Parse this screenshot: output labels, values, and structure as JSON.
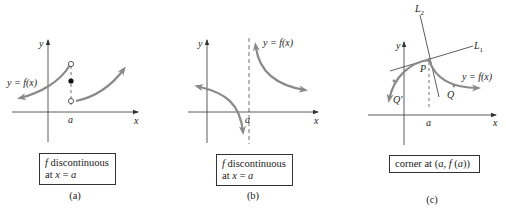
{
  "colors": {
    "curve": "#8a8a8a",
    "axis": "#333333",
    "text": "#222222",
    "background": "#ffffff"
  },
  "panels": [
    {
      "id": "a",
      "caption": "(a)",
      "axis_labels": {
        "x": "x",
        "y": "y"
      },
      "tick_label": "a",
      "curve_label": "y = f(x)",
      "box": {
        "line1_italic": "f",
        "line1_rest": " discontinuous",
        "line2_prefix": "at ",
        "line2_italic": "x",
        "line2_mid": " = ",
        "line2_end": "a"
      },
      "markers": [
        "open-circle-top",
        "filled-dot-middle",
        "open-circle-bottom"
      ]
    },
    {
      "id": "b",
      "caption": "(b)",
      "axis_labels": {
        "x": "x",
        "y": "y"
      },
      "tick_label": "a",
      "curve_label": "y = f(x)",
      "box": {
        "line1_italic": "f",
        "line1_rest": " discontinuous",
        "line2_prefix": "at ",
        "line2_italic": "x",
        "line2_mid": " = ",
        "line2_end": "a"
      },
      "asymptote": "vertical dashed line at x = a"
    },
    {
      "id": "c",
      "caption": "(c)",
      "axis_labels": {
        "x": "x",
        "y": "y"
      },
      "tick_label": "a",
      "curve_label": "y = f(x)",
      "line_labels": {
        "l1": "L",
        "l1_sub": "1",
        "l2": "L",
        "l2_sub": "2"
      },
      "point_labels": {
        "p": "P",
        "q": "Q",
        "q_prime": "Q′"
      },
      "box": {
        "prefix": "corner at (",
        "a": "a",
        "comma": ", ",
        "f": "f",
        "paren": " (",
        "a2": "a",
        "suffix": "))"
      }
    }
  ]
}
